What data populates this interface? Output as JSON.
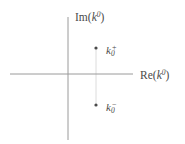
{
  "figure": {
    "background_color": "#ffffff",
    "axis_color": "#9a9a9a",
    "connector_color": "#dcdcdc",
    "point_color": "#4a4a4a",
    "text_color": "#4a4a4a"
  },
  "axes": {
    "imaginary": {
      "label_function": "Im",
      "label_open_paren": "(",
      "label_variable": "k",
      "label_exponent": "0",
      "label_close_paren": ")",
      "label_full": "Im(k0)",
      "orientation": "vertical",
      "x": 68,
      "y_start": 17,
      "y_end": 140
    },
    "real": {
      "label_function": "Re",
      "label_open_paren": "(",
      "label_variable": "k",
      "label_exponent": "0",
      "label_close_paren": ")",
      "label_full": "Re(k0)",
      "orientation": "horizontal",
      "y": 74,
      "x_start": 10,
      "x_end": 133
    }
  },
  "chart_data": {
    "type": "scatter",
    "title": "",
    "xlabel": "Re(k0)",
    "ylabel": "Im(k0)",
    "xlim": [
      -1,
      1
    ],
    "ylim": [
      -1,
      1
    ],
    "grid": false,
    "legend": null,
    "origin_px": [
      68,
      74
    ],
    "points": [
      {
        "name": "k0-plus",
        "label_variable": "k",
        "label_subscript": "0",
        "label_superscript": "+",
        "label_full": "k0+",
        "px": [
          96,
          48
        ],
        "py": 48,
        "quadrant": "upper-right",
        "description": "pole above the real axis, right of the imaginary axis"
      },
      {
        "name": "k0-minus",
        "label_variable": "k",
        "label_subscript": "0",
        "label_superscript": "−",
        "label_full": "k0-",
        "px": [
          96,
          105
        ],
        "py": 105,
        "quadrant": "lower-right",
        "description": "pole below the real axis, right of the imaginary axis"
      }
    ],
    "connector": {
      "name": "pole-connector-line",
      "from_px": [
        96,
        48
      ],
      "to_px": [
        96,
        105
      ],
      "style": "faint vertical line"
    }
  }
}
